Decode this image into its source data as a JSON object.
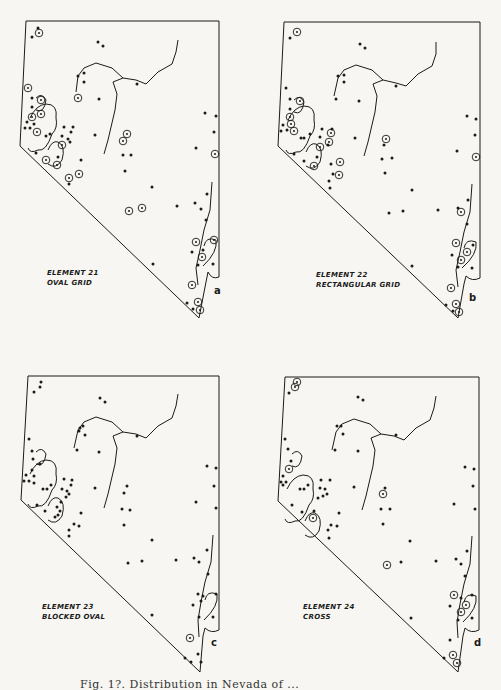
{
  "figure": {
    "caption_partial": "Fig. 1?. Distribution in Nevada of ...",
    "panels": [
      {
        "id": "a",
        "letter": "a",
        "title": "ELEMENT 21",
        "subtitle": "OVAL GRID"
      },
      {
        "id": "b",
        "letter": "b",
        "title": "ELEMENT 22",
        "subtitle": "RECTANGULAR GRID"
      },
      {
        "id": "c",
        "letter": "c",
        "title": "ELEMENT 23",
        "subtitle": "BLOCKED OVAL"
      },
      {
        "id": "d",
        "letter": "d",
        "title": "ELEMENT 24",
        "subtitle": "CROSS"
      }
    ],
    "legend": {
      "dot": "sampling site",
      "circled_dot": "site where element recorded"
    },
    "colors": {
      "ink": "#1b1b1b",
      "paper": "#f7f6f2"
    }
  }
}
